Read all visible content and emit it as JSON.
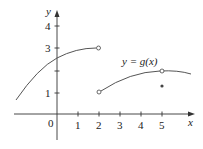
{
  "figure": {
    "function_label": "y = g(x)",
    "axis_x_label": "x",
    "axis_y_label": "y",
    "origin_label": "0",
    "x_ticks": [
      "1",
      "2",
      "3",
      "4",
      "5"
    ],
    "y_ticks": [
      "1",
      "3",
      "4"
    ],
    "colors": {
      "curve": "#555555",
      "axis": "#333333",
      "text": "#222222"
    }
  },
  "graph_points": {
    "open_circles": [
      [
        2,
        3
      ],
      [
        2,
        1
      ],
      [
        5,
        2
      ]
    ],
    "filled_dots": [
      [
        5,
        1.2
      ]
    ],
    "left_branch": {
      "from_x": -1.95,
      "to_x": 2,
      "end_y": 3,
      "y_at_0": 2.6
    },
    "right_branch": {
      "from_x": 2,
      "to_x": 6.4,
      "start_y": 1,
      "peak": [
        5,
        2
      ]
    }
  }
}
